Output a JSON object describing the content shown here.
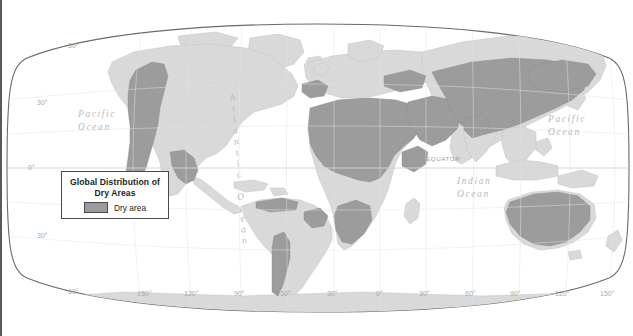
{
  "figure": {
    "kind": "thematic-world-map",
    "projection": "robinson",
    "background_color": "#ffffff",
    "land_color": "#d9d9d9",
    "dry_color": "#9c9c9c",
    "coast_color": "#bdbdbd",
    "frame_color": "#5a5a5a",
    "label_color": "#b9b9b9",
    "left_rule_color": "#5a5a5a"
  },
  "legend": {
    "title_line1": "Global Distribution of",
    "title_line2": "Dry Areas",
    "swatch_label": "Dry area",
    "swatch_color": "#9c9c9c"
  },
  "ocean_labels": {
    "pacific_left_line1": "Pacific",
    "pacific_left_line2": "Ocean",
    "pacific_right_line1": "Pacific",
    "pacific_right_line2": "Ocean",
    "indian_line1": "Indian",
    "indian_line2": "Ocean",
    "atlantic": "Atlantic Ocean",
    "atlantic_letters": [
      "A",
      "t",
      "l",
      "a",
      "n",
      "t",
      "i",
      "c",
      " ",
      "O",
      "c",
      "e",
      "a",
      "n"
    ]
  },
  "equator": {
    "label": "EQUATOR"
  },
  "graticule": {
    "latitude_labels": [
      {
        "text": "60°",
        "x": 66,
        "y": 42
      },
      {
        "text": "30°",
        "x": 35,
        "y": 99
      },
      {
        "text": "0°",
        "x": 26,
        "y": 164
      },
      {
        "text": "30°",
        "x": 35,
        "y": 232
      },
      {
        "text": "60°",
        "x": 66,
        "y": 288
      }
    ],
    "longitude_labels": [
      {
        "text": "150°",
        "x": 135
      },
      {
        "text": "120°",
        "x": 182
      },
      {
        "text": "90°",
        "x": 232
      },
      {
        "text": "60°",
        "x": 278
      },
      {
        "text": "30°",
        "x": 325
      },
      {
        "text": "0°",
        "x": 374
      },
      {
        "text": "30°",
        "x": 417
      },
      {
        "text": "60°",
        "x": 463
      },
      {
        "text": "90°",
        "x": 508
      },
      {
        "text": "120°",
        "x": 553
      },
      {
        "text": "150°",
        "x": 598
      }
    ],
    "longitude_label_y": 290
  }
}
